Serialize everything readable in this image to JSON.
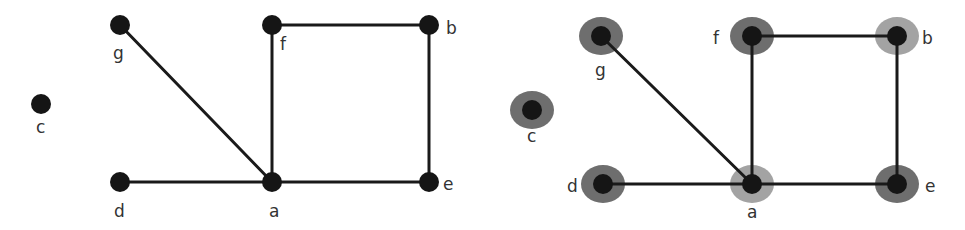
{
  "colors": {
    "node": "#151515",
    "edge": "#1a1a1a",
    "label": "#333333",
    "halo_dark": "#6e6e6e",
    "halo_light": "#a3a3a3",
    "background": "#ffffff"
  },
  "graphs": [
    {
      "name": "plain-graph",
      "node_radius": 10,
      "nodes": [
        {
          "id": "g",
          "label": "g",
          "x": 120,
          "y": 25,
          "lx": 113,
          "ly": 59
        },
        {
          "id": "f",
          "label": "f",
          "x": 272,
          "y": 25,
          "lx": 280,
          "ly": 50
        },
        {
          "id": "b",
          "label": "b",
          "x": 429,
          "y": 25,
          "lx": 446,
          "ly": 34
        },
        {
          "id": "c",
          "label": "c",
          "x": 41,
          "y": 104,
          "lx": 36,
          "ly": 133
        },
        {
          "id": "d",
          "label": "d",
          "x": 120,
          "y": 182,
          "lx": 114,
          "ly": 217
        },
        {
          "id": "a",
          "label": "a",
          "x": 272,
          "y": 182,
          "lx": 269,
          "ly": 217
        },
        {
          "id": "e",
          "label": "e",
          "x": 429,
          "y": 182,
          "lx": 443,
          "ly": 190
        }
      ],
      "edges": [
        [
          "g",
          "a"
        ],
        [
          "f",
          "a"
        ],
        [
          "f",
          "b"
        ],
        [
          "b",
          "e"
        ],
        [
          "d",
          "a"
        ],
        [
          "a",
          "e"
        ]
      ]
    },
    {
      "name": "colored-graph",
      "node_radius": 10,
      "halo_rx": 22,
      "halo_ry": 19,
      "nodes": [
        {
          "id": "g",
          "label": "g",
          "x": 601,
          "y": 36,
          "lx": 595,
          "ly": 76,
          "halo": "dark"
        },
        {
          "id": "f",
          "label": "f",
          "x": 752,
          "y": 36,
          "lx": 713,
          "ly": 44,
          "halo": "dark"
        },
        {
          "id": "b",
          "label": "b",
          "x": 897,
          "y": 36,
          "lx": 922,
          "ly": 44,
          "halo": "light"
        },
        {
          "id": "c",
          "label": "c",
          "x": 532,
          "y": 110,
          "lx": 527,
          "ly": 142,
          "halo": "dark"
        },
        {
          "id": "d",
          "label": "d",
          "x": 603,
          "y": 184,
          "lx": 567,
          "ly": 192,
          "halo": "dark"
        },
        {
          "id": "a",
          "label": "a",
          "x": 752,
          "y": 184,
          "lx": 747,
          "ly": 218,
          "halo": "light"
        },
        {
          "id": "e",
          "label": "e",
          "x": 897,
          "y": 184,
          "lx": 925,
          "ly": 192,
          "halo": "dark"
        }
      ],
      "edges": [
        [
          "g",
          "a"
        ],
        [
          "f",
          "a"
        ],
        [
          "f",
          "b"
        ],
        [
          "b",
          "e"
        ],
        [
          "d",
          "a"
        ],
        [
          "a",
          "e"
        ]
      ]
    }
  ]
}
